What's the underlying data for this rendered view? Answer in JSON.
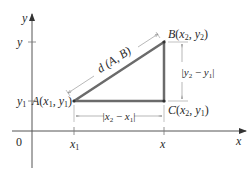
{
  "diagram": {
    "type": "distance-formula-right-triangle",
    "axes": {
      "x_label": "x",
      "y_label": "y",
      "origin_label": "0",
      "x_ticks": [
        {
          "label": "x",
          "sub": "1"
        },
        {
          "label": "x",
          "sub": ""
        }
      ],
      "y_ticks": [
        {
          "label": "y",
          "sub": "1"
        },
        {
          "label": "y",
          "sub": ""
        }
      ]
    },
    "points": {
      "A": {
        "name": "A",
        "x": "x",
        "x_sub": "1",
        "y": "y",
        "y_sub": "1"
      },
      "B": {
        "name": "B",
        "x": "x",
        "x_sub": "2",
        "y": "y",
        "y_sub": "2"
      },
      "C": {
        "name": "C",
        "x": "x",
        "x_sub": "2",
        "y": "y",
        "y_sub": "1"
      }
    },
    "labels": {
      "hypotenuse": "d (A, B)",
      "horizontal": {
        "a": "x",
        "a_sub": "2",
        "b": "x",
        "b_sub": "1"
      },
      "vertical": {
        "a": "y",
        "a_sub": "2",
        "b": "y",
        "b_sub": "1"
      }
    },
    "colors": {
      "triangle": "#6b6b6b",
      "axes": "#444444",
      "dimension_lines": "#8a8a8a",
      "text": "#2a2a2a"
    }
  }
}
